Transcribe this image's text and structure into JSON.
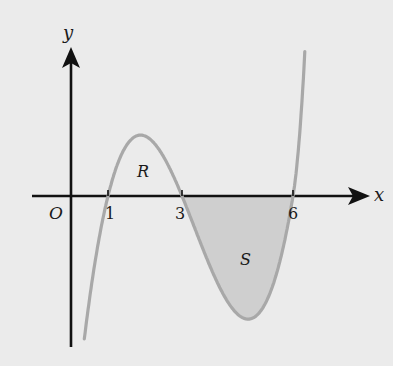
{
  "diagram": {
    "type": "cubic-curve-graph",
    "axes": {
      "x_label": "x",
      "y_label": "y",
      "origin_label": "O"
    },
    "x_ticks": [
      {
        "value": 1,
        "label": "1"
      },
      {
        "value": 3,
        "label": "3"
      },
      {
        "value": 6,
        "label": "6"
      }
    ],
    "roots": [
      1,
      3,
      6
    ],
    "regions": [
      {
        "name": "R",
        "label": "R",
        "from": 1,
        "to": 3,
        "position": "above x-axis",
        "shaded": false
      },
      {
        "name": "S",
        "label": "S",
        "from": 3,
        "to": 6,
        "position": "below x-axis",
        "shaded": true
      }
    ],
    "colors": {
      "background": "#ebebeb",
      "axes": "#111111",
      "curve": "#a8a8a8",
      "shade": "#cfcfcf"
    }
  }
}
